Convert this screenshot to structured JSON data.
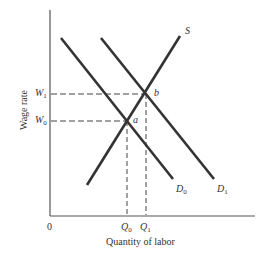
{
  "diagram": {
    "title": "",
    "axes": {
      "x_label": "Quantity of labor",
      "y_label": "Wage rate",
      "origin_label": "0"
    },
    "curves": [
      {
        "id": "S",
        "label": "S",
        "type": "supply"
      },
      {
        "id": "D0",
        "label": "D",
        "subscript": "0",
        "type": "demand"
      },
      {
        "id": "D1",
        "label": "D",
        "subscript": "1",
        "type": "demand"
      }
    ],
    "points": [
      {
        "id": "a",
        "label": "a",
        "wage": "W0",
        "quantity": "Q0"
      },
      {
        "id": "b",
        "label": "b",
        "wage": "W1",
        "quantity": "Q1"
      }
    ],
    "y_ticks": [
      {
        "label": "W",
        "subscript": "1"
      },
      {
        "label": "W",
        "subscript": "0"
      }
    ],
    "x_ticks": [
      {
        "label": "Q",
        "subscript": "0"
      },
      {
        "label": "Q",
        "subscript": "1"
      }
    ],
    "colors": {
      "curve": "#333333",
      "axis": "#555555",
      "guide": "#444444"
    }
  }
}
